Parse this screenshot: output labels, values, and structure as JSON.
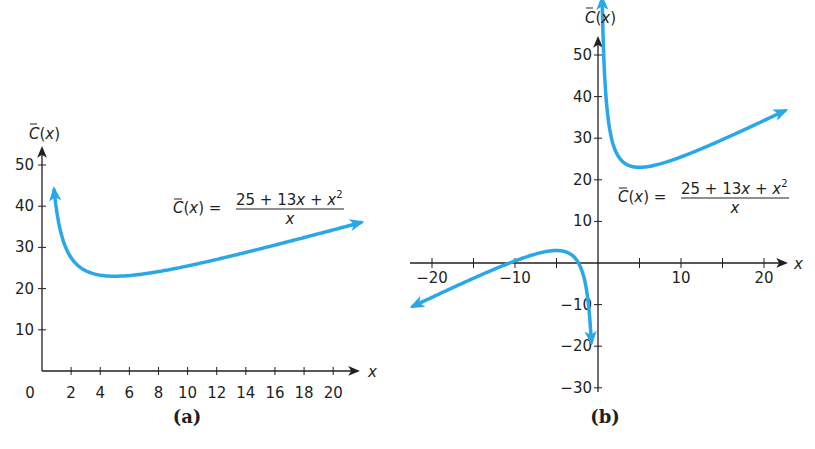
{
  "curve_color": "#2aa7e8",
  "axis_color": "#231f20",
  "chart_data": [
    {
      "type": "line",
      "panel_label": "(a)",
      "title": "",
      "function": "C̄(x) = (25 + 13x + x^2) / x",
      "formula": {
        "lhs": "C̄(x) =",
        "numerator": "25 + 13x + x",
        "numerator_exp": "2",
        "denominator": "x"
      },
      "xlabel": "x",
      "ylabel": "C̄(x)",
      "xlim": [
        0,
        22
      ],
      "ylim": [
        0,
        55
      ],
      "x_ticks": [
        2,
        4,
        6,
        8,
        10,
        12,
        14,
        16,
        18,
        20
      ],
      "y_ticks": [
        10,
        20,
        30,
        40,
        50
      ],
      "origin_label": "0",
      "grid": false,
      "series": [
        {
          "name": "C̄(x)",
          "x": [
            0.5,
            0.75,
            1,
            1.5,
            2,
            3,
            4,
            5,
            6,
            8,
            10,
            12,
            14,
            16,
            18,
            20,
            21.9
          ],
          "y": [
            64.0,
            47.1,
            39.0,
            31.2,
            27.5,
            24.3,
            23.25,
            23.0,
            23.17,
            24.1,
            25.5,
            27.1,
            28.8,
            30.6,
            32.4,
            34.25,
            36.0
          ]
        }
      ],
      "annotations": [
        "arrowheads at both curve ends"
      ]
    },
    {
      "type": "line",
      "panel_label": "(b)",
      "title": "",
      "function": "C̄(x) = (25 + 13x + x^2) / x",
      "formula": {
        "lhs": "C̄(x) =",
        "numerator": "25 + 13x + x",
        "numerator_exp": "2",
        "denominator": "x"
      },
      "xlabel": "x",
      "ylabel": "C̄(x)",
      "xlim": [
        -22,
        22
      ],
      "ylim": [
        -30,
        55
      ],
      "x_ticks": [
        -20,
        -15,
        -10,
        -5,
        5,
        10,
        15,
        20
      ],
      "x_tick_labels": [
        "−20",
        "−10",
        "10",
        "20"
      ],
      "x_tick_label_values": [
        -20,
        -10,
        10,
        20
      ],
      "y_ticks": [
        -30,
        -20,
        -10,
        10,
        20,
        30,
        40,
        50
      ],
      "y_tick_labels": [
        "−30",
        "−20",
        "−10",
        "10",
        "20",
        "30",
        "40",
        "50"
      ],
      "grid": false,
      "series": [
        {
          "name": "C̄(x) for x > 0",
          "x": [
            0.5,
            0.75,
            1,
            1.5,
            2,
            3,
            4,
            5,
            6,
            8,
            10,
            12,
            14,
            16,
            18,
            20,
            22.5
          ],
          "y": [
            64.0,
            47.1,
            39.0,
            31.2,
            27.5,
            24.3,
            23.25,
            23.0,
            23.17,
            24.1,
            25.5,
            27.1,
            28.8,
            30.6,
            32.4,
            34.25,
            36.6
          ]
        },
        {
          "name": "C̄(x) for x < 0",
          "x": [
            -22.3,
            -20,
            -15,
            -10,
            -7,
            -5,
            -4,
            -3,
            -2,
            -1.5,
            -1,
            -0.8
          ],
          "y": [
            -10.4,
            -8.25,
            -3.67,
            0.5,
            2.43,
            3.0,
            2.75,
            1.67,
            -1.5,
            -5.2,
            -13.0,
            -19.05
          ]
        }
      ],
      "annotations": [
        "arrowheads at all three curve ends",
        "vertical asymptote at x = 0"
      ]
    }
  ]
}
